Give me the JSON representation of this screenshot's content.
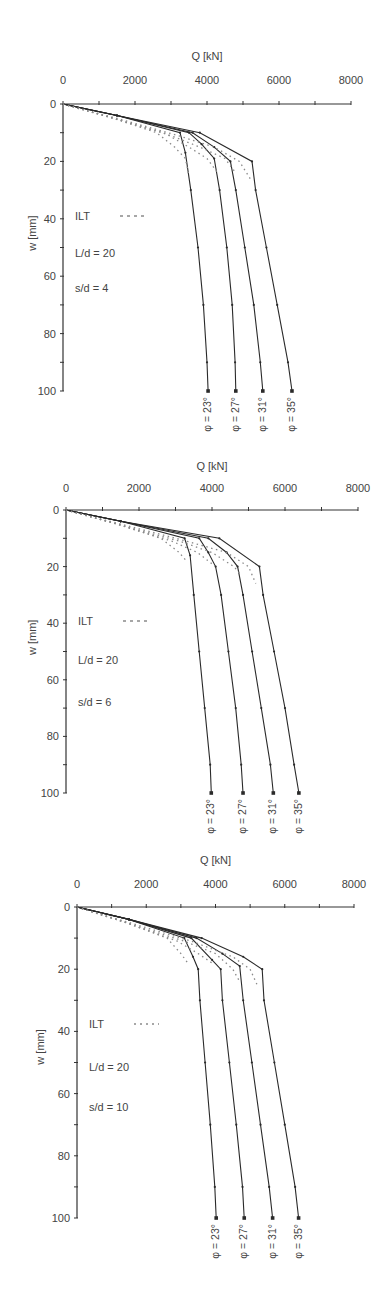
{
  "chart_data": [
    {
      "type": "line",
      "title": "",
      "xlabel": "Q [kN]",
      "ylabel": "w [mm]",
      "xlim": [
        0,
        8000
      ],
      "ylim": [
        0,
        100
      ],
      "y_inverted": true,
      "x_axis_position": "top",
      "xticks": [
        0,
        2000,
        4000,
        6000,
        8000
      ],
      "yticks": [
        0,
        20,
        40,
        60,
        80,
        100
      ],
      "grid": false,
      "legend": {
        "label": "ILT",
        "style": "dashed",
        "position": "inside-left"
      },
      "annotations": [
        "L/d = 20",
        "s/d = 4"
      ],
      "series": [
        {
          "name": "φ = 23°",
          "model": [
            [
              0,
              0
            ],
            [
              1500,
              4
            ],
            [
              3250,
              10
            ],
            [
              3400,
              17
            ],
            [
              3550,
              30
            ],
            [
              3750,
              50
            ],
            [
              3900,
              70
            ],
            [
              4000,
              90
            ],
            [
              4030,
              100
            ]
          ],
          "ilt": [
            [
              0,
              0
            ],
            [
              1400,
              5
            ],
            [
              2600,
              10
            ],
            [
              3100,
              15
            ],
            [
              3400,
              19
            ],
            [
              3500,
              25
            ]
          ]
        },
        {
          "name": "φ = 27°",
          "model": [
            [
              0,
              0
            ],
            [
              1500,
              4
            ],
            [
              3500,
              10
            ],
            [
              3850,
              14
            ],
            [
              4200,
              19
            ],
            [
              4350,
              30
            ],
            [
              4550,
              50
            ],
            [
              4700,
              70
            ],
            [
              4780,
              90
            ],
            [
              4800,
              100
            ]
          ],
          "ilt": [
            [
              0,
              0
            ],
            [
              1400,
              5
            ],
            [
              2800,
              10
            ],
            [
              3500,
              15
            ],
            [
              4000,
              19
            ],
            [
              4300,
              24
            ]
          ]
        },
        {
          "name": "φ = 31°",
          "model": [
            [
              0,
              0
            ],
            [
              1500,
              4
            ],
            [
              3600,
              10
            ],
            [
              4200,
              15
            ],
            [
              4650,
              20
            ],
            [
              4800,
              30
            ],
            [
              5050,
              50
            ],
            [
              5300,
              70
            ],
            [
              5480,
              90
            ],
            [
              5550,
              100
            ]
          ],
          "ilt": [
            [
              0,
              0
            ],
            [
              1400,
              5
            ],
            [
              3000,
              11
            ],
            [
              3800,
              15
            ],
            [
              4500,
              19
            ],
            [
              4800,
              24
            ]
          ]
        },
        {
          "name": "φ = 35°",
          "model": [
            [
              0,
              0
            ],
            [
              1500,
              4
            ],
            [
              3800,
              10
            ],
            [
              5250,
              20
            ],
            [
              5350,
              30
            ],
            [
              5650,
              50
            ],
            [
              5950,
              70
            ],
            [
              6250,
              90
            ],
            [
              6360,
              100
            ]
          ],
          "ilt": [
            [
              0,
              0
            ],
            [
              1500,
              5
            ],
            [
              3200,
              11
            ],
            [
              4200,
              15
            ],
            [
              4900,
              20
            ],
            [
              5200,
              26
            ]
          ]
        }
      ]
    },
    {
      "type": "line",
      "title": "",
      "xlabel": "Q [kN]",
      "ylabel": "w [mm]",
      "xlim": [
        0,
        8000
      ],
      "ylim": [
        0,
        100
      ],
      "y_inverted": true,
      "x_axis_position": "top",
      "xticks": [
        0,
        2000,
        4000,
        6000,
        8000
      ],
      "yticks": [
        0,
        20,
        40,
        60,
        80,
        100
      ],
      "grid": false,
      "legend": {
        "label": "ILT",
        "style": "dashed",
        "position": "inside-left"
      },
      "annotations": [
        "L/d = 20",
        "s/d = 6"
      ],
      "series": [
        {
          "name": "φ = 23°",
          "model": [
            [
              0,
              0
            ],
            [
              1500,
              4
            ],
            [
              3250,
              10
            ],
            [
              3400,
              16
            ],
            [
              3500,
              30
            ],
            [
              3650,
              50
            ],
            [
              3800,
              70
            ],
            [
              3950,
              90
            ],
            [
              3980,
              100
            ]
          ],
          "ilt": [
            [
              0,
              0
            ],
            [
              1400,
              5
            ],
            [
              2600,
              10
            ],
            [
              3100,
              15
            ],
            [
              3300,
              18
            ]
          ]
        },
        {
          "name": "φ = 27°",
          "model": [
            [
              0,
              0
            ],
            [
              1500,
              4
            ],
            [
              3650,
              10
            ],
            [
              3900,
              15
            ],
            [
              4100,
              20
            ],
            [
              4250,
              30
            ],
            [
              4450,
              50
            ],
            [
              4650,
              70
            ],
            [
              4800,
              90
            ],
            [
              4850,
              100
            ]
          ],
          "ilt": [
            [
              0,
              0
            ],
            [
              1400,
              5
            ],
            [
              2900,
              11
            ],
            [
              3600,
              15
            ],
            [
              4000,
              19
            ]
          ]
        },
        {
          "name": "φ = 31°",
          "model": [
            [
              0,
              0
            ],
            [
              1500,
              4
            ],
            [
              3900,
              10
            ],
            [
              4400,
              15
            ],
            [
              4700,
              20
            ],
            [
              4850,
              30
            ],
            [
              5100,
              50
            ],
            [
              5350,
              70
            ],
            [
              5600,
              90
            ],
            [
              5680,
              100
            ]
          ],
          "ilt": [
            [
              0,
              0
            ],
            [
              1400,
              5
            ],
            [
              3100,
              11
            ],
            [
              4000,
              15
            ],
            [
              4600,
              20
            ],
            [
              4800,
              23
            ]
          ]
        },
        {
          "name": "φ = 35°",
          "model": [
            [
              0,
              0
            ],
            [
              1500,
              4
            ],
            [
              4200,
              10
            ],
            [
              5300,
              20
            ],
            [
              5400,
              30
            ],
            [
              5700,
              50
            ],
            [
              6000,
              70
            ],
            [
              6250,
              90
            ],
            [
              6380,
              100
            ]
          ],
          "ilt": [
            [
              0,
              0
            ],
            [
              1500,
              5
            ],
            [
              3300,
              11
            ],
            [
              4400,
              15
            ],
            [
              5000,
              20
            ],
            [
              5200,
              26
            ]
          ]
        }
      ]
    },
    {
      "type": "line",
      "title": "",
      "xlabel": "Q [kN]",
      "ylabel": "w [mm]",
      "xlim": [
        0,
        8000
      ],
      "ylim": [
        0,
        100
      ],
      "y_inverted": true,
      "x_axis_position": "top",
      "xticks": [
        0,
        2000,
        4000,
        6000,
        8000
      ],
      "yticks": [
        0,
        20,
        40,
        60,
        80,
        100
      ],
      "grid": false,
      "legend": {
        "label": "ILT",
        "style": "dotted",
        "position": "inside-left"
      },
      "annotations": [
        "L/d = 20",
        "s/d = 10"
      ],
      "series": [
        {
          "name": "φ = 23°",
          "model": [
            [
              0,
              0
            ],
            [
              1500,
              4
            ],
            [
              3100,
              10
            ],
            [
              3350,
              16
            ],
            [
              3500,
              20
            ],
            [
              3550,
              30
            ],
            [
              3700,
              50
            ],
            [
              3850,
              70
            ],
            [
              3980,
              90
            ],
            [
              4020,
              100
            ]
          ],
          "ilt": [
            [
              0,
              0
            ],
            [
              1400,
              5
            ],
            [
              2600,
              10
            ],
            [
              3000,
              15
            ],
            [
              3200,
              18
            ]
          ]
        },
        {
          "name": "φ = 27°",
          "model": [
            [
              0,
              0
            ],
            [
              1500,
              4
            ],
            [
              3300,
              10
            ],
            [
              3900,
              17
            ],
            [
              4150,
              20
            ],
            [
              4200,
              30
            ],
            [
              4400,
              50
            ],
            [
              4600,
              70
            ],
            [
              4780,
              90
            ],
            [
              4830,
              100
            ]
          ],
          "ilt": [
            [
              0,
              0
            ],
            [
              1400,
              5
            ],
            [
              2900,
              11
            ],
            [
              3500,
              15
            ],
            [
              3900,
              18
            ]
          ]
        },
        {
          "name": "φ = 31°",
          "model": [
            [
              0,
              0
            ],
            [
              1500,
              4
            ],
            [
              3450,
              10
            ],
            [
              4200,
              15
            ],
            [
              4700,
              19
            ],
            [
              4800,
              30
            ],
            [
              5050,
              50
            ],
            [
              5300,
              70
            ],
            [
              5550,
              90
            ],
            [
              5650,
              100
            ]
          ],
          "ilt": [
            [
              0,
              0
            ],
            [
              1400,
              5
            ],
            [
              3100,
              11
            ],
            [
              4000,
              15
            ],
            [
              4500,
              20
            ],
            [
              4700,
              24
            ]
          ]
        },
        {
          "name": "φ = 35°",
          "model": [
            [
              0,
              0
            ],
            [
              1500,
              4
            ],
            [
              3600,
              10
            ],
            [
              4800,
              16
            ],
            [
              5350,
              20
            ],
            [
              5400,
              30
            ],
            [
              5700,
              50
            ],
            [
              6000,
              70
            ],
            [
              6300,
              90
            ],
            [
              6400,
              100
            ]
          ],
          "ilt": [
            [
              0,
              0
            ],
            [
              1500,
              5
            ],
            [
              3300,
              11
            ],
            [
              4500,
              16
            ],
            [
              5000,
              20
            ],
            [
              5200,
              25
            ]
          ]
        }
      ]
    }
  ],
  "charts": [
    {
      "x_title": "Q [kN]",
      "y_title": "w [mm]",
      "legend_label": "ILT",
      "ann_ld": "L/d = 20",
      "ann_sd": "s/d = 4",
      "xtick_labels": [
        "0",
        "2000",
        "4000",
        "6000",
        "8000"
      ],
      "ytick_labels": [
        "0",
        "20",
        "40",
        "60",
        "80",
        "100"
      ],
      "phi_labels": [
        "φ = 23°",
        "φ = 27°",
        "φ = 31°",
        "φ = 35°"
      ]
    },
    {
      "x_title": "Q [kN]",
      "y_title": "w [mm]",
      "legend_label": "ILT",
      "ann_ld": "L/d = 20",
      "ann_sd": "s/d = 6",
      "xtick_labels": [
        "0",
        "2000",
        "4000",
        "6000",
        "8000"
      ],
      "ytick_labels": [
        "0",
        "20",
        "40",
        "60",
        "80",
        "100"
      ],
      "phi_labels": [
        "φ = 23°",
        "φ = 27°",
        "φ = 31°",
        "φ = 35°"
      ]
    },
    {
      "x_title": "Q [kN]",
      "y_title": "w [mm]",
      "legend_label": "ILT",
      "ann_ld": "L/d = 20",
      "ann_sd": "s/d = 10",
      "xtick_labels": [
        "0",
        "2000",
        "4000",
        "6000",
        "8000"
      ],
      "ytick_labels": [
        "0",
        "20",
        "40",
        "60",
        "80",
        "100"
      ],
      "phi_labels": [
        "φ = 23°",
        "φ = 27°",
        "φ = 31°",
        "φ = 35°"
      ]
    }
  ],
  "colors": {
    "axis": "#333333",
    "model_line": "#2a2a2a",
    "ilt_line": "#8a8a8a",
    "text": "#444444",
    "background": "#ffffff"
  }
}
